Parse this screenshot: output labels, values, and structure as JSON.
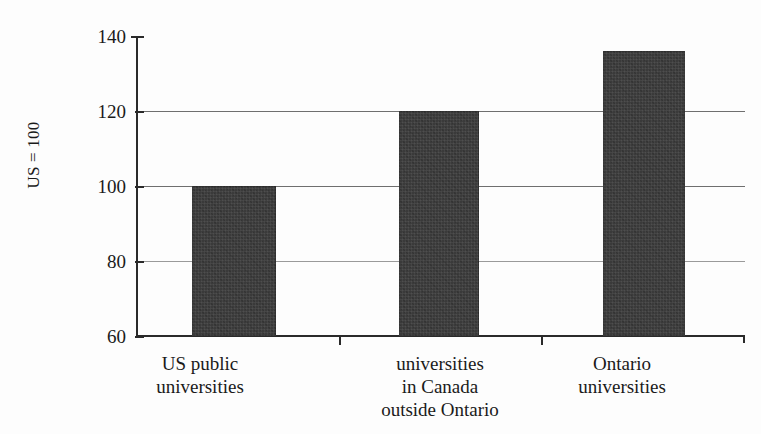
{
  "figure": {
    "title_clipped": "",
    "background_color": "#fdfdfd",
    "bar_color": "#3a3a3a",
    "axis_color": "#2a2a2a",
    "grid_color": "#6f6f6f"
  },
  "chart_data": {
    "type": "bar",
    "title": "",
    "xlabel": "",
    "ylabel": "US = 100",
    "categories": [
      "US public\nuniversities",
      "universities\nin Canada\noutside Ontario",
      "Ontario\nuniversities"
    ],
    "values": [
      100,
      120,
      136
    ],
    "ylim": [
      60,
      140
    ],
    "yticks": [
      60,
      80,
      100,
      120,
      140
    ],
    "ytick_labels": [
      "60",
      "80",
      "100",
      "120",
      "140"
    ],
    "grid": true,
    "gridlines_at": [
      80,
      100,
      120
    ],
    "legend": null,
    "legend_position": "none",
    "series": [
      {
        "name": "Index (US = 100)",
        "values": [
          100,
          120,
          136
        ]
      }
    ]
  },
  "axis": {
    "y_title": "US = 100",
    "ticks": [
      {
        "label": "140",
        "value": 140
      },
      {
        "label": "120",
        "value": 120
      },
      {
        "label": "100",
        "value": 100
      },
      {
        "label": "80",
        "value": 80
      },
      {
        "label": "60",
        "value": 60
      }
    ]
  },
  "bars": [
    {
      "label": "US public\nuniversities",
      "value": 100
    },
    {
      "label": "universities\nin Canada\noutside Ontario",
      "value": 120
    },
    {
      "label": "Ontario\nuniversities",
      "value": 136
    }
  ]
}
